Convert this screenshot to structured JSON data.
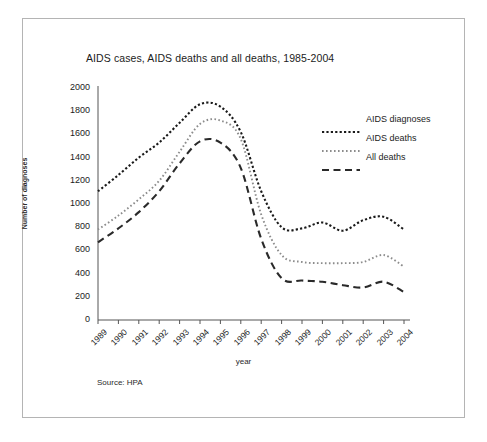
{
  "figure": {
    "source_note": "Source: HPA",
    "frame_color": "#b4b4b4"
  },
  "chart_data": {
    "type": "line",
    "title": "AIDS cases, AIDS deaths and all deaths, 1985-2004",
    "xlabel": "year",
    "ylabel": "Number of diagnoses",
    "categories": [
      "1989",
      "1990",
      "1991",
      "1992",
      "1993",
      "1994",
      "1995",
      "1996",
      "1997",
      "1998",
      "1999",
      "2000",
      "2001",
      "2002",
      "2003",
      "2004"
    ],
    "ylim": [
      0,
      2000
    ],
    "ytick_values": [
      0,
      200,
      400,
      600,
      800,
      1000,
      1200,
      1400,
      1600,
      1800,
      2000
    ],
    "ytick_labels": [
      "0",
      "200",
      "400",
      "600",
      "800",
      "1000",
      "1200",
      "1400",
      "1600",
      "1800",
      "2000"
    ],
    "grid": false,
    "legend_position": "upper right",
    "series": [
      {
        "name": "AIDS diagnoses",
        "style": "dotted",
        "color": "#1a1a1a",
        "values": [
          1110,
          1250,
          1400,
          1530,
          1700,
          1860,
          1840,
          1620,
          1110,
          800,
          790,
          840,
          770,
          860,
          890,
          780
        ]
      },
      {
        "name": "AIDS deaths",
        "style": "dotted-light",
        "color": "#8c8c8c",
        "values": [
          780,
          900,
          1040,
          1200,
          1450,
          1690,
          1720,
          1560,
          910,
          560,
          500,
          490,
          490,
          500,
          560,
          460
        ]
      },
      {
        "name": "All deaths",
        "style": "dashed",
        "color": "#2a2a2a",
        "values": [
          670,
          790,
          930,
          1110,
          1350,
          1540,
          1530,
          1310,
          700,
          360,
          340,
          330,
          300,
          280,
          330,
          240
        ]
      }
    ]
  }
}
